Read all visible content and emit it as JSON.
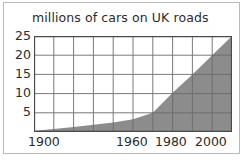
{
  "chart_data": {
    "type": "area",
    "title": "millions of cars on UK roads",
    "xlabel": "",
    "ylabel": "",
    "grid": true,
    "legend": "none",
    "xlim": [
      1900,
      2000
    ],
    "ylim": [
      0,
      25
    ],
    "xticks": [
      1900,
      1960,
      1980,
      2000
    ],
    "xtick_labels": [
      "1900",
      "1960",
      "1980",
      "2000"
    ],
    "yticks": [
      5,
      10,
      15,
      20,
      25
    ],
    "ytick_labels": [
      "5",
      "10",
      "15",
      "20",
      "25"
    ],
    "x_gridlines": [
      1900,
      1910,
      1920,
      1930,
      1940,
      1950,
      1960,
      1970,
      1980,
      1990,
      2000
    ],
    "series": [
      {
        "name": "cars on UK roads",
        "fill_color": "#8c8c8c",
        "x": [
          1900,
          1910,
          1920,
          1930,
          1940,
          1950,
          1960,
          1970,
          1980,
          1990,
          2000
        ],
        "values": [
          0.3,
          0.8,
          1.3,
          1.9,
          2.5,
          3.3,
          5.0,
          10.2,
          15.0,
          20.0,
          25.0
        ]
      }
    ]
  },
  "axis": {
    "y_labels": [
      "25",
      "20",
      "15",
      "10",
      "5"
    ],
    "x_labels": [
      "1900",
      "1960",
      "1980",
      "2000"
    ]
  },
  "colors": {
    "fill": "#8c8c8c",
    "grid": "#6e6e6e",
    "axis": "#4a4a4a",
    "text": "#2b2b2b",
    "border": "#b9b9b9",
    "background": "#ffffff"
  }
}
